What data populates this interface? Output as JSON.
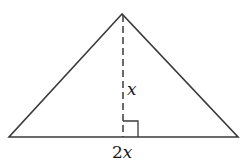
{
  "diagram": {
    "shape": "isosceles-triangle",
    "stroke_color": "#3a3a3a",
    "background": "#ffffff",
    "vertices": {
      "apex": [
        122,
        14
      ],
      "base_left": [
        9,
        137
      ],
      "base_right": [
        238,
        137
      ]
    },
    "altitude": {
      "style": "dashed",
      "x": 123,
      "y_top": 14,
      "y_bottom": 137
    },
    "right_angle_marker": {
      "x": 123,
      "y": 121,
      "size": 16
    },
    "labels": {
      "height": "x",
      "base_coef": "2",
      "base_var": "x"
    }
  }
}
